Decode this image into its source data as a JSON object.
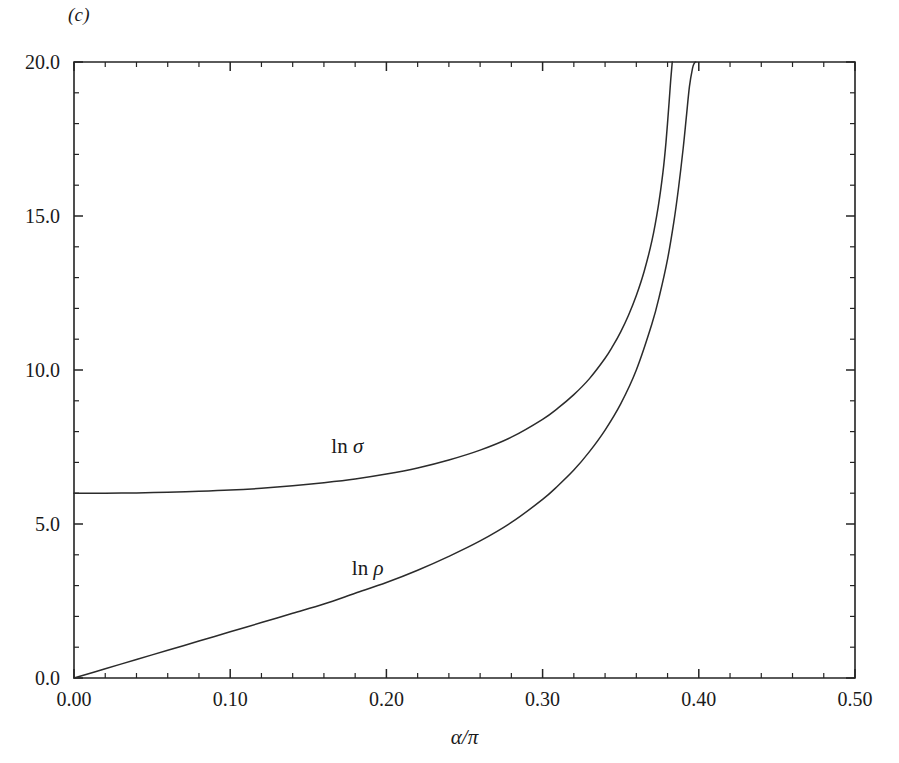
{
  "figure": {
    "panel_label": "(c)",
    "background_color": "#ffffff",
    "line_color": "#2b2b2b",
    "axis_color": "#242424",
    "width": 899,
    "height": 763
  },
  "chart_data": {
    "type": "line",
    "title": "",
    "subtitle": "",
    "xlabel": "α/π",
    "ylabel": "",
    "xlim": [
      0.0,
      0.5
    ],
    "ylim": [
      0.0,
      20.0
    ],
    "grid": false,
    "legend_position": "inline-annotation",
    "x_ticks_major": [
      0.0,
      0.1,
      0.2,
      0.3,
      0.4,
      0.5
    ],
    "x_ticklabels": [
      "0.00",
      "0.10",
      "0.20",
      "0.30",
      "0.40",
      "0.50"
    ],
    "x_tick_minor_step": 0.02,
    "y_ticks_major": [
      0.0,
      5.0,
      10.0,
      15.0,
      20.0
    ],
    "y_ticklabels": [
      "0.0",
      "5.0",
      "10.0",
      "15.0",
      "20.0"
    ],
    "y_tick_minor_step": 1.0,
    "annotations": [
      {
        "text": "ln σ",
        "head": "ln ",
        "symbol": "σ",
        "x": 0.175,
        "y": 7.3
      },
      {
        "text": "ln ρ",
        "head": "ln ",
        "symbol": "ρ",
        "x": 0.188,
        "y": 3.35
      }
    ],
    "series": [
      {
        "name": "ln σ",
        "asymptote_x": 0.383,
        "x": [
          0.0,
          0.02,
          0.04,
          0.06,
          0.08,
          0.1,
          0.12,
          0.14,
          0.16,
          0.18,
          0.2,
          0.22,
          0.24,
          0.26,
          0.28,
          0.3,
          0.31,
          0.32,
          0.33,
          0.34,
          0.345,
          0.35,
          0.355,
          0.36,
          0.365,
          0.37,
          0.374,
          0.377,
          0.379,
          0.381,
          0.382,
          0.383
        ],
        "values": [
          6.0,
          6.0,
          6.01,
          6.03,
          6.06,
          6.1,
          6.16,
          6.24,
          6.34,
          6.46,
          6.62,
          6.82,
          7.08,
          7.4,
          7.82,
          8.4,
          8.77,
          9.2,
          9.72,
          10.38,
          10.78,
          11.24,
          11.78,
          12.42,
          13.2,
          14.2,
          15.3,
          16.4,
          17.4,
          18.7,
          19.4,
          20.0
        ]
      },
      {
        "name": "ln ρ",
        "asymptote_x": 0.398,
        "x": [
          0.0,
          0.02,
          0.04,
          0.06,
          0.08,
          0.1,
          0.12,
          0.14,
          0.16,
          0.18,
          0.2,
          0.22,
          0.24,
          0.26,
          0.28,
          0.3,
          0.31,
          0.32,
          0.33,
          0.34,
          0.35,
          0.36,
          0.37,
          0.375,
          0.38,
          0.384,
          0.387,
          0.39,
          0.392,
          0.394,
          0.396,
          0.397,
          0.398
        ],
        "values": [
          0.0,
          0.3,
          0.6,
          0.9,
          1.2,
          1.5,
          1.8,
          2.1,
          2.4,
          2.75,
          3.1,
          3.5,
          3.95,
          4.45,
          5.05,
          5.8,
          6.25,
          6.75,
          7.35,
          8.05,
          8.9,
          10.0,
          11.5,
          12.45,
          13.6,
          14.8,
          15.9,
          17.2,
          18.2,
          19.2,
          19.8,
          19.95,
          20.0
        ]
      }
    ]
  }
}
